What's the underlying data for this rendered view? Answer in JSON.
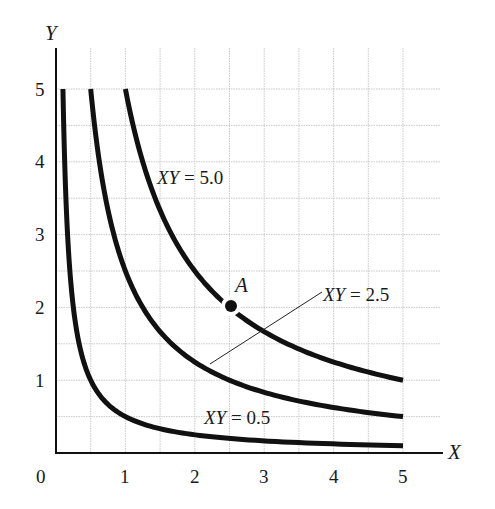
{
  "chart_data": {
    "type": "line",
    "title": "",
    "xlabel": "X",
    "ylabel": "Y",
    "xlim": [
      0,
      5
    ],
    "ylim": [
      0,
      5
    ],
    "grid": true,
    "grid_step": 0.5,
    "origin_label": "0",
    "x_ticks": [
      "1",
      "2",
      "3",
      "4",
      "5"
    ],
    "y_ticks": [
      "1",
      "2",
      "3",
      "4",
      "5"
    ],
    "series": [
      {
        "name": "XY = 0.5",
        "product": 0.5,
        "x_range": [
          0.1,
          5
        ],
        "points": [
          [
            0.1,
            5
          ],
          [
            0.2,
            2.5
          ],
          [
            0.5,
            1
          ],
          [
            1,
            0.5
          ],
          [
            2,
            0.25
          ],
          [
            3,
            0.167
          ],
          [
            4,
            0.125
          ],
          [
            5,
            0.1
          ]
        ]
      },
      {
        "name": "XY = 2.5",
        "product": 2.5,
        "x_range": [
          0.5,
          5
        ],
        "points": [
          [
            0.5,
            5
          ],
          [
            1,
            2.5
          ],
          [
            2,
            1.25
          ],
          [
            2.5,
            1
          ],
          [
            3,
            0.833
          ],
          [
            4,
            0.625
          ],
          [
            5,
            0.5
          ]
        ]
      },
      {
        "name": "XY = 5.0",
        "product": 5.0,
        "x_range": [
          1,
          5
        ],
        "points": [
          [
            1,
            5
          ],
          [
            2,
            2.5
          ],
          [
            2.5,
            2
          ],
          [
            3,
            1.667
          ],
          [
            4,
            1.25
          ],
          [
            5,
            1
          ]
        ]
      }
    ],
    "annotations": [
      {
        "label": "A",
        "x": 2.5,
        "y": 2,
        "type": "point",
        "on_series": "XY = 5.0"
      },
      {
        "label": "XY = 5.0",
        "x": 1.5,
        "y": 3.9
      },
      {
        "label": "XY = 2.5",
        "x": 3.8,
        "y": 2.1,
        "leader_to": [
          2.2,
          1.25
        ]
      },
      {
        "label": "XY = 0.5",
        "x": 2.1,
        "y": 0.45
      }
    ]
  },
  "labels": {
    "x_axis": "X",
    "y_axis": "Y",
    "origin": "0",
    "point_a": "A",
    "curve_high": {
      "var": "XY",
      "eq": " = ",
      "val": "5.0"
    },
    "curve_mid": {
      "var": "XY",
      "eq": " = ",
      "val": "2.5"
    },
    "curve_low": {
      "var": "XY",
      "eq": " = ",
      "val": "0.5"
    },
    "x_ticks": [
      "1",
      "2",
      "3",
      "4",
      "5"
    ],
    "y_ticks": [
      "1",
      "2",
      "3",
      "4",
      "5"
    ]
  }
}
